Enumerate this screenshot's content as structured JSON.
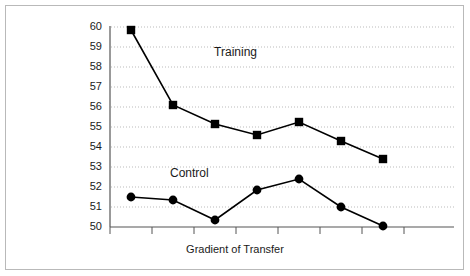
{
  "chart_data": {
    "type": "line",
    "title": "",
    "xlabel": "Gradient of Transfer",
    "ylabel": "",
    "ylim": [
      50,
      60
    ],
    "yticks": [
      50,
      51,
      52,
      53,
      54,
      55,
      56,
      57,
      58,
      59,
      60
    ],
    "ytick_labels": [
      "50",
      "51",
      "52",
      "53",
      "54",
      "55",
      "56",
      "57",
      "58",
      "59",
      "60"
    ],
    "x": [
      1,
      2,
      3,
      4,
      5,
      6,
      7
    ],
    "xtick_labels": [
      "",
      "",
      "",
      "",
      "",
      "",
      ""
    ],
    "grid": true,
    "grid_axis": "y",
    "legend": "inline-annotations",
    "series": [
      {
        "name": "Training",
        "marker": "square",
        "values": [
          59.85,
          56.1,
          55.15,
          54.6,
          55.25,
          54.3,
          53.4
        ]
      },
      {
        "name": "Control",
        "marker": "circle",
        "values": [
          51.5,
          51.35,
          50.35,
          51.85,
          52.4,
          51.0,
          50.05
        ]
      }
    ],
    "annotations": [
      {
        "text": "Training",
        "x": 3.55,
        "y": 58.75
      },
      {
        "text": "Control",
        "x": 2.5,
        "y": 52.7
      }
    ],
    "colors": {
      "line": "#000000",
      "marker": "#000000",
      "grid": "#aaaaaa",
      "axis": "#555555",
      "text": "#1a1a1a",
      "background": "#ffffff",
      "border": "#b9b9b9"
    }
  }
}
